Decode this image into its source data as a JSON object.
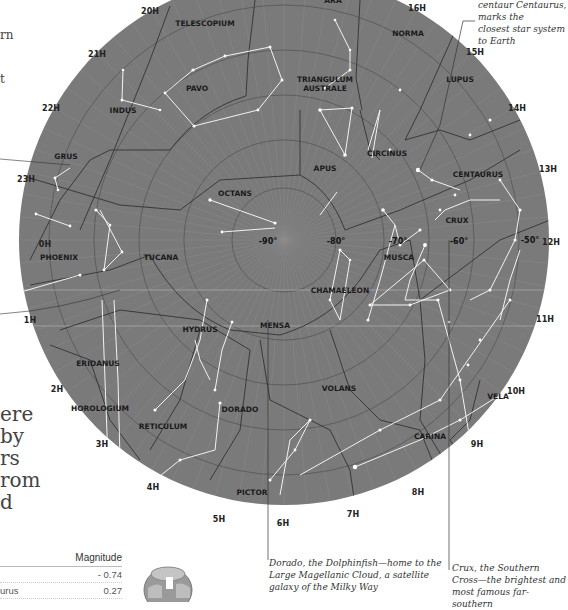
{
  "chart_data": {
    "type": "star-chart",
    "center": "South celestial pole (-90°)",
    "hour_labels": [
      "0H",
      "1H",
      "2H",
      "3H",
      "4H",
      "5H",
      "6H",
      "7H",
      "8H",
      "9H",
      "10H",
      "11H",
      "12H",
      "13H",
      "14H",
      "15H",
      "16H",
      "20H",
      "21H",
      "22H",
      "23H"
    ],
    "declination_labels": [
      "-90°",
      "-80°",
      "-70°",
      "-60°",
      "-50°"
    ],
    "constellations": [
      "TELESCOPIUM",
      "ARA",
      "NORMA",
      "LUPUS",
      "PAVO",
      "TRIANGULUM AUSTRALE",
      "INDUS",
      "APUS",
      "CIRCINUS",
      "CENTAURUS",
      "GRUS",
      "OCTANS",
      "CRUX",
      "PHOENIX",
      "TUCANA",
      "MUSCA",
      "CHAMAELEON",
      "HYDRUS",
      "MENSA",
      "ERIDANUS",
      "HOROLOGIUM",
      "RETICULUM",
      "DORADO",
      "VOLANS",
      "VELA",
      "CARINA",
      "PICTOR"
    ],
    "colors": {
      "sky": "#7a7a7a",
      "boundary": "#3a3a3a",
      "stick": "#f2f2f2",
      "grid": "#8f8f8f"
    }
  },
  "annotations": {
    "centaurus": [
      "centaur Centaurus, marks the",
      "closest star system to Earth"
    ],
    "dorado": [
      "Dorado, the Dolphinfish—home to the",
      "Large Magellanic Cloud, a satellite",
      "galaxy of the Milky Way"
    ],
    "crux": [
      "Crux, the Southern",
      "Cross—the brightest and",
      "most famous far-southern"
    ]
  },
  "left_text_fragments": [
    "rn",
    "t",
    "ere",
    "by",
    "rs",
    "rom",
    "d"
  ],
  "table": {
    "header": "Magnitude",
    "rows": [
      {
        "name": "",
        "value": "- 0.74"
      },
      {
        "name": "urus",
        "value": "0.27"
      }
    ]
  }
}
